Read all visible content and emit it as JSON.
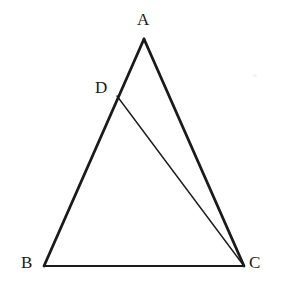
{
  "figure": {
    "background_color": "#ffffff",
    "stroke_color": "#1a1a1a",
    "label_color": "#1a1a1a",
    "width": 285,
    "height": 301
  },
  "labels": {
    "a": "A",
    "b": "B",
    "c": "C",
    "d": "D"
  },
  "geometry": {
    "points": {
      "A": {
        "x": 144,
        "y": 39
      },
      "B": {
        "x": 44,
        "y": 266
      },
      "C": {
        "x": 244,
        "y": 266
      },
      "D": {
        "x": 117,
        "y": 96
      }
    },
    "segments": [
      {
        "name": "AB",
        "from": "A",
        "to": "B",
        "stroke_width": 2.8
      },
      {
        "name": "AC",
        "from": "A",
        "to": "C",
        "stroke_width": 2.8
      },
      {
        "name": "BC",
        "from": "B",
        "to": "C",
        "stroke_width": 2.2
      },
      {
        "name": "DC",
        "from": "D",
        "to": "C",
        "stroke_width": 1.4
      }
    ]
  }
}
